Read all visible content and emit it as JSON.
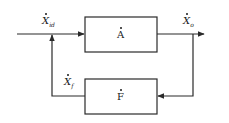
{
  "diagram": {
    "type": "feedback-block-diagram",
    "colors": {
      "line": "#2a2a2a",
      "background": "#ffffff"
    },
    "nodes": [
      {
        "id": "A",
        "label": "A",
        "role": "forward-block"
      },
      {
        "id": "F",
        "label": "F",
        "role": "feedback-block"
      }
    ],
    "signals": {
      "input": {
        "symbol": "X",
        "sub": "id"
      },
      "output": {
        "symbol": "X",
        "sub": "o"
      },
      "feedback": {
        "symbol": "X",
        "sub": "f"
      }
    },
    "edges": [
      {
        "from": "input",
        "to": "A"
      },
      {
        "from": "A",
        "to": "output"
      },
      {
        "from": "output",
        "to": "F"
      },
      {
        "from": "F",
        "to": "A-input-junction"
      }
    ]
  }
}
